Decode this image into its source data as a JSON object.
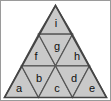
{
  "figure": {
    "shape": "equilateral-triangle",
    "rows": 3,
    "cell_count": 9,
    "colors": {
      "fill": "#c9c9c9",
      "stroke": "#555555",
      "outer_stroke": "#444444",
      "background": "#ffffff",
      "frame": "#9a9a9a",
      "label": "#101010"
    },
    "geometry": {
      "apex_x": 55.5,
      "apex_y": 5.5,
      "base_y": 97.5,
      "base_left_x": 4.5,
      "base_right_x": 106.5,
      "row_divider_y": [
        34.2,
        65.8
      ]
    },
    "cells": [
      {
        "id": "cell-i",
        "label": "i",
        "row": 1,
        "orientation": "up",
        "label_x": 56,
        "label_y": 24,
        "points": "55.5,5.5 72.5,34.2 38.5,34.2"
      },
      {
        "id": "cell-f",
        "label": "f",
        "row": 2,
        "orientation": "up",
        "label_x": 36,
        "label_y": 57,
        "points": "38.5,34.2 55.5,65.8 21.5,65.8"
      },
      {
        "id": "cell-g",
        "label": "g",
        "row": 2,
        "orientation": "down",
        "label_x": 57,
        "label_y": 47,
        "points": "38.5,34.2 72.5,34.2 55.5,65.8"
      },
      {
        "id": "cell-h",
        "label": "h",
        "row": 2,
        "orientation": "up",
        "label_x": 77,
        "label_y": 57,
        "points": "72.5,34.2 89.5,65.8 55.5,65.8"
      },
      {
        "id": "cell-a",
        "label": "a",
        "row": 3,
        "orientation": "up",
        "label_x": 19,
        "label_y": 89,
        "points": "21.5,65.8 38.5,97.5 4.5,97.5"
      },
      {
        "id": "cell-b",
        "label": "b",
        "row": 3,
        "orientation": "down",
        "label_x": 39,
        "label_y": 79,
        "points": "21.5,65.8 55.5,65.8 38.5,97.5"
      },
      {
        "id": "cell-c",
        "label": "c",
        "row": 3,
        "orientation": "up",
        "label_x": 57,
        "label_y": 89,
        "points": "55.5,65.8 72.5,97.5 38.5,97.5"
      },
      {
        "id": "cell-d",
        "label": "d",
        "row": 3,
        "orientation": "down",
        "label_x": 74,
        "label_y": 79,
        "points": "55.5,65.8 89.5,65.8 72.5,97.5"
      },
      {
        "id": "cell-e",
        "label": "e",
        "row": 3,
        "orientation": "up",
        "label_x": 92,
        "label_y": 89,
        "points": "89.5,65.8 106.5,97.5 72.5,97.5"
      }
    ],
    "outline_points": "55.5,5.5 106.5,97.5 4.5,97.5"
  }
}
